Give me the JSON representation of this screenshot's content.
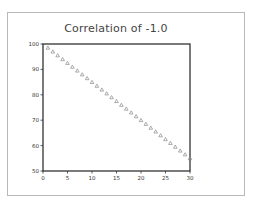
{
  "chart_data": {
    "type": "scatter",
    "title": "Correlation of -1.0",
    "xlabel": "",
    "ylabel": "",
    "xlim": [
      0,
      30
    ],
    "ylim": [
      50,
      100
    ],
    "x_ticks": [
      0,
      5,
      10,
      15,
      20,
      25,
      30
    ],
    "y_ticks": [
      50,
      60,
      70,
      80,
      90,
      100
    ],
    "x_tick_labels": [
      "0",
      "5",
      "10",
      "15",
      "20",
      "25",
      "30"
    ],
    "y_tick_labels": [
      "50",
      "60",
      "70",
      "80",
      "90",
      "100"
    ],
    "grid": false,
    "legend": null,
    "marker": "triangle",
    "marker_color": "#8a8a8a",
    "series": [
      {
        "name": "data",
        "x": [
          1,
          2,
          3,
          4,
          5,
          6,
          7,
          8,
          9,
          10,
          11,
          12,
          13,
          14,
          15,
          16,
          17,
          18,
          19,
          20,
          21,
          22,
          23,
          24,
          25,
          26,
          27,
          28,
          29,
          30
        ],
        "y": [
          98.5,
          97,
          95.5,
          94,
          92.5,
          91,
          89.5,
          88,
          86.5,
          85,
          83.5,
          82,
          80.5,
          79,
          77.5,
          76,
          74.5,
          73,
          71.5,
          70,
          68.5,
          67,
          65.5,
          64,
          62.5,
          61,
          59.5,
          58,
          56.5,
          55
        ]
      }
    ]
  },
  "colors": {
    "frame_border": "#b8b8b8",
    "axis": "#333333",
    "marker": "#8a8a8a",
    "title": "#444444"
  }
}
